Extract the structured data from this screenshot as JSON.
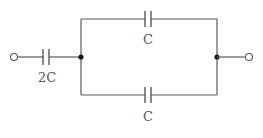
{
  "diagram": {
    "type": "circuit",
    "components": [
      {
        "id": "cap-series",
        "type": "capacitor",
        "label": "2C",
        "position": "left-series"
      },
      {
        "id": "cap-top",
        "type": "capacitor",
        "label": "C",
        "position": "top-branch"
      },
      {
        "id": "cap-bottom",
        "type": "capacitor",
        "label": "C",
        "position": "bottom-branch"
      }
    ],
    "terminals": [
      {
        "id": "terminal-left",
        "position": "left"
      },
      {
        "id": "terminal-right",
        "position": "right"
      }
    ],
    "nodes": [
      {
        "id": "node-left",
        "position": "left-junction"
      },
      {
        "id": "node-right",
        "position": "right-junction"
      }
    ],
    "colors": {
      "wire": "#5a5a5a",
      "node": "#1a1a1a",
      "label": "#555555",
      "background": "#ffffff"
    }
  }
}
